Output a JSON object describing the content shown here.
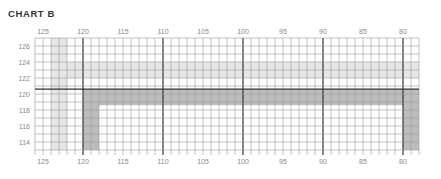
{
  "title": "CHART B",
  "chart_data": {
    "type": "heatmap",
    "title": "CHART B",
    "xlabel": "",
    "ylabel": "",
    "x_ticks": [
      125,
      120,
      115,
      110,
      105,
      100,
      95,
      90,
      85,
      80
    ],
    "y_ticks": [
      126,
      124,
      122,
      120,
      118,
      116,
      114
    ],
    "xlim": [
      126,
      78
    ],
    "ylim": [
      113,
      127
    ],
    "grid": true,
    "x_axis_labels_top_and_bottom": true,
    "emphasized_lines": {
      "vertical": [
        120,
        110,
        100,
        90,
        80
      ],
      "horizontal": [
        120.6
      ]
    },
    "shaded_regions": [
      {
        "shade": "light",
        "orientation": "horizontal",
        "x_range": [
          124,
          78
        ],
        "y_range": [
          122,
          124
        ],
        "color": "#e6e6e6"
      },
      {
        "shade": "light",
        "orientation": "vertical",
        "x_range": [
          124,
          122
        ],
        "y_range": [
          113,
          127
        ],
        "color": "#e6e6e6"
      },
      {
        "shade": "dark",
        "orientation": "horizontal",
        "x_range": [
          120,
          78
        ],
        "y_range": [
          118.6,
          120.6
        ],
        "color": "#bdbdbd"
      },
      {
        "shade": "dark",
        "orientation": "vertical",
        "x_range": [
          120,
          118
        ],
        "y_range": [
          113,
          120.6
        ],
        "color": "#bdbdbd"
      },
      {
        "shade": "dark",
        "orientation": "vertical",
        "x_range": [
          80,
          78
        ],
        "y_range": [
          113,
          120.6
        ],
        "color": "#bdbdbd"
      }
    ]
  },
  "colors": {
    "grid_minor": "#9a9a9a",
    "grid_major": "#333333",
    "light_band": "#e6e6e6",
    "dark_band": "#bdbdbd",
    "label": "#8a8a8a"
  }
}
